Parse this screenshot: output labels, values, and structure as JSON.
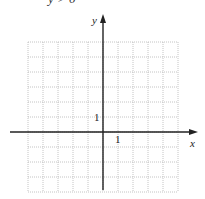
{
  "header_text": "y > 0",
  "graph": {
    "x_axis_label": "x",
    "y_axis_label": "y",
    "x_tick_label": "1",
    "y_tick_label": "1",
    "x_range": [
      -5,
      5
    ],
    "y_range": [
      -4,
      6
    ],
    "grid_step": 1,
    "grid_color": "#b5b5b5",
    "axis_color": "#222222"
  }
}
